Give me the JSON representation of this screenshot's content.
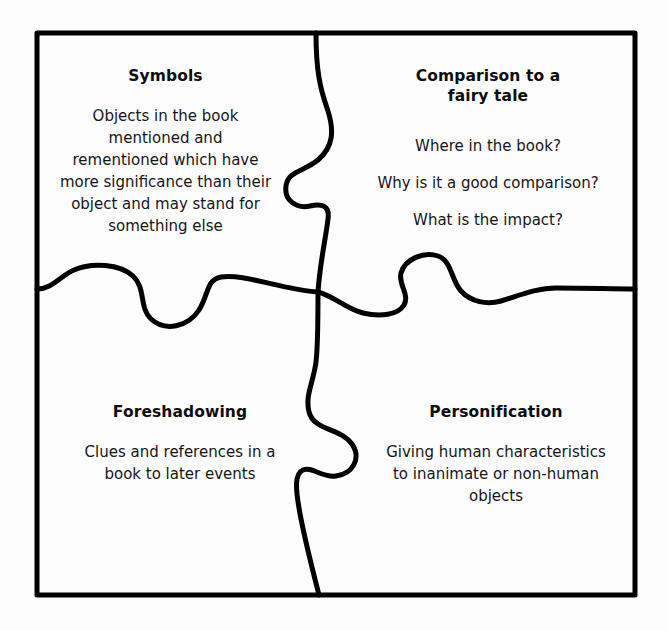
{
  "diagram": {
    "type": "four-piece-jigsaw-puzzle",
    "stroke_color": "#000000",
    "background_color": "#ffffff",
    "text_color": "#111111",
    "frame": {
      "left": 37,
      "top": 33,
      "right": 635,
      "bottom": 595
    }
  },
  "quadrants": {
    "top_left": {
      "title": "Symbols",
      "body": "Objects in the book\nmentioned and\nrementioned which have\nmore significance than their\nobject and may stand for\nsomething else"
    },
    "top_right": {
      "title": "Comparison to a\nfairy tale",
      "body": "Where in the book?\nWhy is it a good comparison?\nWhat is the impact?"
    },
    "bottom_left": {
      "title": "Foreshadowing",
      "body": "Clues and references in a\nbook to later events"
    },
    "bottom_right": {
      "title": "Personification",
      "body": "Giving human characteristics\nto inanimate or non-human\nobjects"
    }
  }
}
